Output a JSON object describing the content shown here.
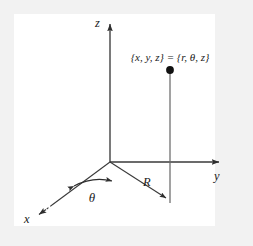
{
  "figure": {
    "name": "cylindrical-coordinates-diagram",
    "background_color": "#f2f2f2",
    "panel_color": "#ffffff",
    "line_color": "#3a3a3a",
    "text_color": "#1a1a1a",
    "axes": {
      "z": {
        "label": "z"
      },
      "y": {
        "label": "y"
      },
      "x": {
        "label": "x"
      }
    },
    "annotations": {
      "point_coordinates": "{x, y, z} = {r, θ, z}",
      "radial_distance": "R",
      "azimuth_angle": "θ"
    }
  }
}
